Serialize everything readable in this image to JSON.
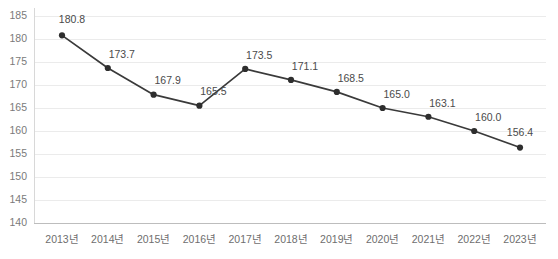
{
  "chart_data": {
    "type": "line",
    "title": "",
    "subtitle": "",
    "xlabel": "",
    "ylabel": "",
    "categories": [
      "2013년",
      "2014년",
      "2015년",
      "2016년",
      "2017년",
      "2018년",
      "2019년",
      "2020년",
      "2021년",
      "2022년",
      "2023년"
    ],
    "values": [
      180.8,
      173.7,
      167.9,
      165.5,
      173.5,
      171.1,
      168.5,
      165.0,
      163.1,
      160.0,
      156.4
    ],
    "point_labels": [
      "180.8",
      "173.7",
      "167.9",
      "165.5",
      "173.5",
      "171.1",
      "168.5",
      "165.0",
      "163.1",
      "160.0",
      "156.4"
    ],
    "series": [
      {
        "name": "",
        "values": [
          180.8,
          173.7,
          167.9,
          165.5,
          173.5,
          171.1,
          168.5,
          165.0,
          163.1,
          160.0,
          156.4
        ]
      }
    ],
    "ylim": [
      140,
      185
    ],
    "ytick_step": 5,
    "yticks": [
      140,
      145,
      150,
      155,
      160,
      165,
      170,
      175,
      180,
      185
    ],
    "ytick_labels": [
      "140",
      "145",
      "150",
      "155",
      "160",
      "165",
      "170",
      "175",
      "180",
      "185"
    ],
    "grid": true,
    "grid_axis": "y",
    "legend": false,
    "legend_position": "none",
    "markers": true,
    "data_labels": true
  },
  "style": {
    "line_color": "#3a3a3a",
    "marker_color": "#2e2e2e",
    "grid_color": "#ebebeb",
    "axis_color": "#bdbdbd",
    "label_color": "#4a4a4a",
    "tick_color": "#7a7a7a",
    "background": "#ffffff"
  }
}
